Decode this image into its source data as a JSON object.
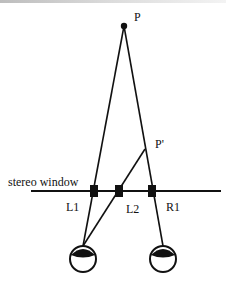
{
  "diagram": {
    "labels": {
      "point_p": "P",
      "point_p_prime": "P'",
      "stereo_window": "stereo window",
      "l1": "L1",
      "l2": "L2",
      "r1": "R1"
    },
    "colors": {
      "stroke": "#111111",
      "background": "#ffffff"
    },
    "nodes": [
      {
        "id": "P",
        "x": 124,
        "y": 26
      },
      {
        "id": "P_prime",
        "x": 145,
        "y": 149
      },
      {
        "id": "L1",
        "x": 94,
        "y": 191
      },
      {
        "id": "L2",
        "x": 119,
        "y": 191
      },
      {
        "id": "R1",
        "x": 152,
        "y": 191
      },
      {
        "id": "left_eye",
        "x": 83,
        "y": 258
      },
      {
        "id": "right_eye",
        "x": 163,
        "y": 258
      }
    ],
    "edges": [
      [
        "left_eye",
        "L1",
        "P"
      ],
      [
        "right_eye",
        "R1",
        "P"
      ],
      [
        "left_eye",
        "L2",
        "P_prime"
      ]
    ]
  }
}
